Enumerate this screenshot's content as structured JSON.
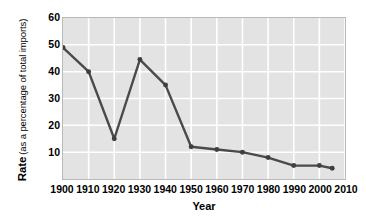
{
  "chart_data": {
    "type": "line",
    "title": "",
    "xlabel": "Year",
    "ylabel": "Rate (as a percentage of total imports)",
    "ylabel_bold": "Rate",
    "ylabel_plain": "(as a percentage of total imports)",
    "x": [
      1900,
      1910,
      1920,
      1930,
      1940,
      1950,
      1960,
      1970,
      1980,
      1990,
      2000,
      2005
    ],
    "values": [
      49,
      40,
      15,
      44.5,
      35,
      12,
      11,
      10,
      8,
      5,
      5,
      4
    ],
    "xlim": [
      1900,
      2010
    ],
    "ylim": [
      0,
      60
    ],
    "xticks": [
      "1900",
      "1910",
      "1920",
      "1930",
      "1940",
      "1950",
      "1960",
      "1970",
      "1980",
      "1990",
      "2000",
      "2010"
    ],
    "yticks": [
      "10",
      "20",
      "30",
      "40",
      "50",
      "60"
    ],
    "ytick_values": [
      10,
      20,
      30,
      40,
      50,
      60
    ],
    "grid": true,
    "legend": "none",
    "colors": {
      "line": "#4a4a4a",
      "marker": "#3f3f3f",
      "plot_background": "#e3e3e3",
      "gridline": "#ffffff",
      "plot_border": "#b9b9b9",
      "text": "#000000",
      "page_background": "#ffffff"
    }
  }
}
